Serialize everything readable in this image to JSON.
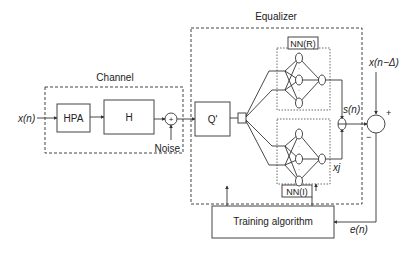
{
  "diagram": {
    "input_label": "x(n)",
    "channel": {
      "title": "Channel",
      "blocks": [
        "HPA",
        "H"
      ],
      "adder_symbol": "+",
      "noise_label": "Noise"
    },
    "equalizer": {
      "title": "Equalizer",
      "quantizer_label": "Q'",
      "nn_real_label": "NN(R)",
      "nn_imag_label": "NN(I)",
      "output_label": "s(n)",
      "imag_output_label": "xj"
    },
    "reference_label": "x(n−Δ)",
    "comparator": {
      "plus": "+",
      "minus": "−"
    },
    "error_label": "e(n)",
    "training_label": "Training algorithm"
  }
}
